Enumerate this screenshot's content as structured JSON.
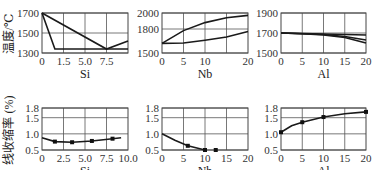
{
  "figure": {
    "row_labels": {
      "top": "温度/℃",
      "bottom": "线收缩率 (%)"
    }
  },
  "chart_data": [
    {
      "type": "line",
      "panel": "top-left",
      "xlabel": "Si",
      "ylabel": "温度/℃",
      "x_tick_labels": [
        "0",
        "1.5",
        "5.0",
        "7.5"
      ],
      "y_tick_labels": [
        "1300",
        "1500",
        "1700"
      ],
      "ylim": [
        1300,
        1700
      ],
      "grid": true,
      "series": [
        {
          "name": "liquidus",
          "x": [
            0,
            7.5,
            10
          ],
          "y": [
            1700,
            1340,
            1420
          ]
        },
        {
          "name": "solidus",
          "x": [
            0,
            1.5,
            10
          ],
          "y": [
            1700,
            1340,
            1340
          ]
        }
      ]
    },
    {
      "type": "line",
      "panel": "top-middle",
      "xlabel": "Nb",
      "ylabel": "温度/℃",
      "x_tick_labels": [
        "0",
        "5",
        "10",
        "20"
      ],
      "y_tick_labels": [
        "1500",
        "1800",
        "2000"
      ],
      "ylim": [
        1500,
        2000
      ],
      "grid": true,
      "series": [
        {
          "name": "liquidus",
          "x": [
            0,
            5,
            10,
            15,
            20
          ],
          "y": [
            1620,
            1780,
            1880,
            1940,
            1970
          ]
        },
        {
          "name": "solidus",
          "x": [
            0,
            5,
            10,
            15,
            20
          ],
          "y": [
            1620,
            1625,
            1660,
            1700,
            1770
          ]
        }
      ]
    },
    {
      "type": "line",
      "panel": "top-right",
      "xlabel": "Al",
      "ylabel": "温度/℃",
      "x_tick_labels": [
        "0",
        "5",
        "10",
        "15",
        "20"
      ],
      "y_tick_labels": [
        "1500",
        "1700",
        "1900"
      ],
      "ylim": [
        1500,
        1900
      ],
      "grid": true,
      "series": [
        {
          "name": "line1",
          "x": [
            0,
            5,
            10,
            15,
            20
          ],
          "y": [
            1700,
            1695,
            1690,
            1685,
            1680
          ]
        },
        {
          "name": "line2",
          "x": [
            0,
            5,
            10,
            15,
            20
          ],
          "y": [
            1700,
            1693,
            1685,
            1665,
            1630
          ]
        },
        {
          "name": "line3",
          "x": [
            0,
            5,
            10,
            15,
            20
          ],
          "y": [
            1700,
            1692,
            1680,
            1655,
            1600
          ]
        }
      ]
    },
    {
      "type": "line",
      "panel": "bottom-left",
      "xlabel": "Si",
      "ylabel": "线收缩率 (%)",
      "x_tick_labels": [
        "0",
        "2.5",
        "5.0",
        "7.5",
        "10.0"
      ],
      "y_tick_labels": [
        "0.5",
        "1.0",
        "1.5",
        "1.8"
      ],
      "xlim": [
        0,
        10
      ],
      "ylim": [
        0.5,
        1.8
      ],
      "grid": true,
      "series": [
        {
          "name": "curve",
          "x": [
            0,
            1.5,
            3.5,
            5.8,
            8.2,
            9.2
          ],
          "y": [
            0.88,
            0.76,
            0.74,
            0.78,
            0.85,
            0.88
          ]
        },
        {
          "name": "points",
          "x": [
            1.5,
            3.5,
            5.8,
            8.2
          ],
          "y": [
            0.76,
            0.74,
            0.78,
            0.85
          ]
        }
      ]
    },
    {
      "type": "line",
      "panel": "bottom-middle",
      "xlabel": "Nb",
      "ylabel": "线收缩率 (%)",
      "x_tick_labels": [
        "0",
        "5",
        "10",
        "15",
        "20"
      ],
      "xlim": [
        0,
        20
      ],
      "y_tick_labels": [
        "0.5",
        "1.0",
        "1.5",
        "1.8"
      ],
      "ylim": [
        0.5,
        1.8
      ],
      "grid": true,
      "series": [
        {
          "name": "curve",
          "x": [
            0,
            3,
            6,
            10
          ],
          "y": [
            1.0,
            0.8,
            0.63,
            0.5
          ]
        },
        {
          "name": "points",
          "x": [
            6,
            10,
            12.5
          ],
          "y": [
            0.63,
            0.5,
            0.5
          ]
        }
      ]
    },
    {
      "type": "line",
      "panel": "bottom-right",
      "xlabel": "Al",
      "ylabel": "线收缩率 (%)",
      "x_tick_labels": [
        "0",
        "5",
        "10",
        "15",
        "20"
      ],
      "xlim": [
        0,
        20
      ],
      "y_tick_labels": [
        "0.5",
        "1.0",
        "1.5",
        "1.8"
      ],
      "ylim": [
        0.5,
        1.8
      ],
      "grid": true,
      "series": [
        {
          "name": "curve",
          "x": [
            0,
            2.5,
            5,
            10,
            15,
            20
          ],
          "y": [
            1.05,
            1.25,
            1.36,
            1.52,
            1.62,
            1.68
          ]
        },
        {
          "name": "points",
          "x": [
            0,
            5,
            10,
            20
          ],
          "y": [
            1.05,
            1.36,
            1.52,
            1.68
          ]
        }
      ]
    }
  ]
}
